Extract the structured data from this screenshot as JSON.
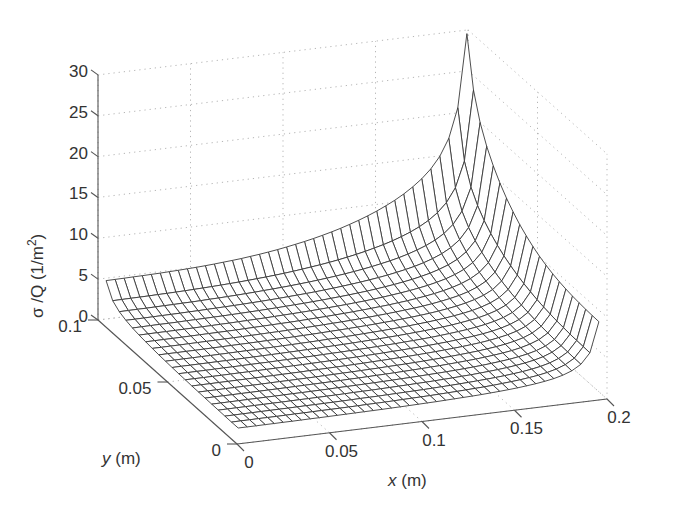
{
  "chart_data": {
    "type": "surface",
    "title": "",
    "xlabel": "x (m)",
    "ylabel": "y (m)",
    "zlabel": "σ /Q (1/m²)",
    "xlim": [
      0,
      0.2
    ],
    "ylim": [
      0,
      0.1
    ],
    "zlim": [
      0,
      30
    ],
    "x_ticks": [
      0,
      0.05,
      0.1,
      0.15,
      0.2
    ],
    "y_ticks": [
      0,
      0.05,
      0.1
    ],
    "z_ticks": [
      0,
      5,
      10,
      15,
      20,
      25,
      30
    ],
    "x_tick_labels": [
      "0",
      "0.05",
      "0.1",
      "0.15",
      "0.2"
    ],
    "y_tick_labels": [
      "0",
      "0.05",
      "0.1"
    ],
    "z_tick_labels": [
      "0",
      "5",
      "10",
      "15",
      "20",
      "25",
      "30"
    ],
    "grid": true,
    "mesh": {
      "nx": 40,
      "ny": 20,
      "x_start": 0.0025,
      "x_end": 0.1975,
      "y_start": 0.0025,
      "y_end": 0.0975
    },
    "surface_profile": {
      "floor_level": 1.5,
      "back_edge_y_max": {
        "x": [
          0,
          0.05,
          0.1,
          0.15,
          0.18,
          0.195
        ],
        "z": [
          9,
          10,
          11.5,
          14,
          17,
          20.5
        ]
      },
      "right_edge_x_max": {
        "y": [
          0,
          0.025,
          0.05,
          0.075,
          0.09,
          0.095
        ],
        "z": [
          9.5,
          10.5,
          12,
          14.5,
          18,
          20.5
        ]
      },
      "corner_peak": {
        "x": 0.2,
        "y": 0.1,
        "z": 30
      }
    },
    "view": {
      "origin_px": [
        237,
        444
      ],
      "x_unit_px": [
        370,
        -45
      ],
      "y_unit_px": [
        -139,
        -124
      ],
      "z_px_per_unit": 8.17
    }
  },
  "labels": {
    "z_axis": "σ /Q (1/m",
    "z_axis_sup": "2",
    "z_axis_end": ")",
    "x_axis_italic": "x",
    "x_axis_rest": " (m)",
    "y_axis_italic": "y",
    "y_axis_rest": " (m)"
  }
}
